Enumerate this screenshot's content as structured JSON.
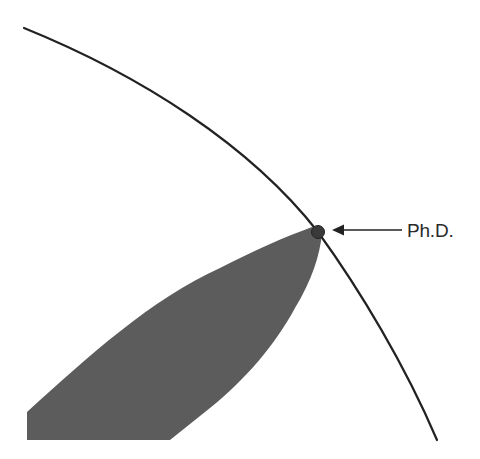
{
  "diagram": {
    "type": "illustration",
    "elements": {
      "boundary_arc": {
        "name": "knowledge-boundary",
        "color": "#222222"
      },
      "specialty_region": {
        "name": "specialty-region",
        "color": "#5c5c5c"
      },
      "contact_dot": {
        "name": "phd-dot",
        "color": "#3a3a3a"
      },
      "annotation": {
        "label": "Ph.D.",
        "arrow": "left-pointing arrow from label to dot",
        "color": "#222222"
      }
    }
  }
}
